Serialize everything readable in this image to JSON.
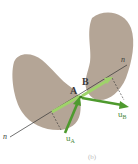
{
  "figure": {
    "caption": "(b)",
    "colors": {
      "body_fill": "#b4a596",
      "body_shade": "#a89888",
      "arrow_dark": "#4e9a2e",
      "arrow_light": "#9fd36a",
      "line": "#333333"
    },
    "bodies": [
      {
        "name": "left-body",
        "description": "lower-left kidney-shaped body containing point A"
      },
      {
        "name": "right-body",
        "description": "upper-right kidney-shaped body containing point B"
      }
    ],
    "points": [
      {
        "label": "A"
      },
      {
        "label": "B"
      }
    ],
    "line_of_impact": {
      "label_start": "n",
      "label_end": "n"
    },
    "velocities": [
      {
        "label": "u",
        "subscript": "A"
      },
      {
        "label": "u",
        "subscript": "B"
      }
    ]
  }
}
